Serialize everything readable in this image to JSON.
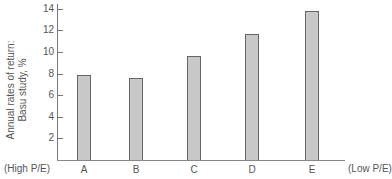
{
  "chart_data": {
    "type": "bar",
    "title": "",
    "xlabel": "",
    "ylabel": "Annual rates of return: Basu study, %",
    "ylabel_lines": [
      "Annual rates of return:",
      "Basu study, %"
    ],
    "categories": [
      "A",
      "B",
      "C",
      "D",
      "E"
    ],
    "values": [
      7.9,
      7.6,
      9.6,
      11.7,
      13.8
    ],
    "ylim": [
      0,
      14
    ],
    "yticks": [
      2,
      4,
      6,
      8,
      10,
      12,
      14
    ],
    "grid": false,
    "legend": null,
    "annotations": {
      "left_end": "(High P/E)",
      "right_end": "(Low P/E)"
    }
  }
}
